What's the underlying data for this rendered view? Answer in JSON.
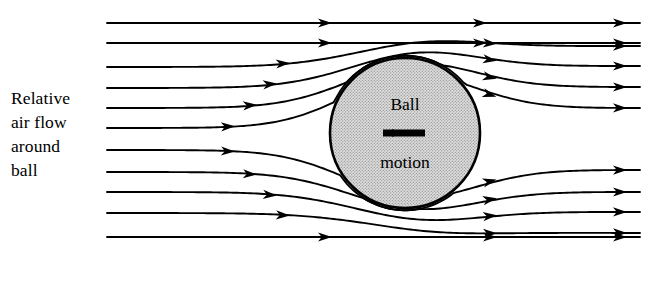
{
  "figure": {
    "name": "air-flow-around-ball-diagram",
    "width": 647,
    "height": 281,
    "background_color": "#ffffff",
    "line_color": "#000000"
  },
  "labels": {
    "flow_label_lines": [
      "Relative",
      "air flow",
      "around",
      "ball"
    ],
    "ball_word": "Ball",
    "motion_word": "motion",
    "motion_arrow_direction": "left"
  },
  "ball": {
    "center_x": 405,
    "center_y": 133,
    "radius": 75,
    "fill_color": "#d2d2d2",
    "outline_color": "#000000",
    "texture": "stipple-halftone"
  },
  "chart_data": {
    "type": "diagram",
    "title": "Relative air flow around ball",
    "stagnation_point_front": {
      "x": 330,
      "y": 133
    },
    "stagnation_point_rear": {
      "x": 480,
      "y": 133
    },
    "inlet_x": 107,
    "outlet_x": 640,
    "streamlines": [
      {
        "id": 1,
        "y_left": 23,
        "y_right": 23,
        "deflect": 0,
        "straight": true,
        "arrows_x": [
          325,
          480,
          620
        ]
      },
      {
        "id": 2,
        "y_left": 43,
        "y_right": 43,
        "deflect": 0,
        "straight": true,
        "arrows_x": [
          325,
          480,
          620
        ]
      },
      {
        "id": 3,
        "y_left": 67,
        "y_right": 46,
        "deflect": -21,
        "straight": false,
        "arrows_x": [
          283,
          490,
          620
        ]
      },
      {
        "id": 4,
        "y_left": 88,
        "y_right": 66,
        "deflect": -22,
        "straight": false,
        "arrows_x": [
          270,
          490,
          620
        ]
      },
      {
        "id": 5,
        "y_left": 108,
        "y_right": 87,
        "deflect": -21,
        "straight": false,
        "arrows_x": [
          250,
          490,
          620
        ]
      },
      {
        "id": 6,
        "y_left": 128,
        "y_right": 108,
        "deflect": -20,
        "straight": false,
        "arrows_x": [
          228,
          490,
          620
        ]
      },
      {
        "id": 7,
        "y_left": 150,
        "y_right": 170,
        "deflect": 20,
        "straight": false,
        "arrows_x": [
          228,
          490,
          620
        ]
      },
      {
        "id": 8,
        "y_left": 172,
        "y_right": 192,
        "deflect": 20,
        "straight": false,
        "arrows_x": [
          250,
          490,
          620
        ]
      },
      {
        "id": 9,
        "y_left": 192,
        "y_right": 212,
        "deflect": 20,
        "straight": false,
        "arrows_x": [
          270,
          490,
          620
        ]
      },
      {
        "id": 10,
        "y_left": 213,
        "y_right": 233,
        "deflect": 20,
        "straight": false,
        "arrows_x": [
          283,
          490,
          620
        ]
      },
      {
        "id": 11,
        "y_left": 237,
        "y_right": 237,
        "deflect": 0,
        "straight": true,
        "arrows_x": [
          325,
          490,
          620
        ]
      }
    ],
    "streamline_count": 11,
    "arrow_count_right_edge": 11
  }
}
